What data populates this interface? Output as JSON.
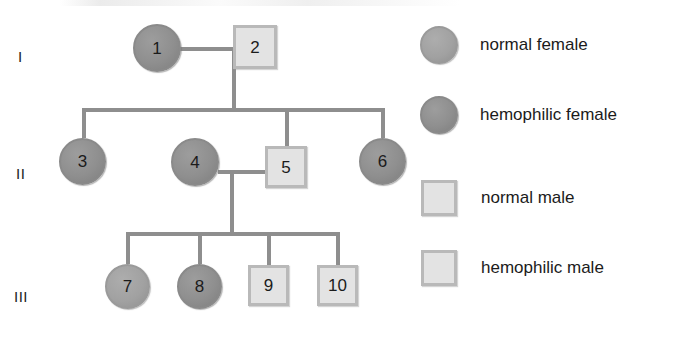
{
  "figure": {
    "type": "pedigree-chart"
  },
  "generations": [
    {
      "label": "I"
    },
    {
      "label": "II"
    },
    {
      "label": "III"
    }
  ],
  "individuals": [
    {
      "id": "1",
      "number": "1",
      "sex": "female",
      "symbol": "circle",
      "status": "hemophilic-female",
      "generation": "I"
    },
    {
      "id": "2",
      "number": "2",
      "sex": "male",
      "symbol": "square",
      "status": "normal-male",
      "generation": "I"
    },
    {
      "id": "3",
      "number": "3",
      "sex": "female",
      "symbol": "circle",
      "status": "hemophilic-female",
      "generation": "II"
    },
    {
      "id": "4",
      "number": "4",
      "sex": "female",
      "symbol": "circle",
      "status": "hemophilic-female",
      "generation": "II"
    },
    {
      "id": "5",
      "number": "5",
      "sex": "male",
      "symbol": "square",
      "status": "normal-male",
      "generation": "II"
    },
    {
      "id": "6",
      "number": "6",
      "sex": "female",
      "symbol": "circle",
      "status": "hemophilic-female",
      "generation": "II"
    },
    {
      "id": "7",
      "number": "7",
      "sex": "female",
      "symbol": "circle",
      "status": "normal-female",
      "generation": "III"
    },
    {
      "id": "8",
      "number": "8",
      "sex": "female",
      "symbol": "circle",
      "status": "hemophilic-female",
      "generation": "III"
    },
    {
      "id": "9",
      "number": "9",
      "sex": "male",
      "symbol": "square",
      "status": "normal-male",
      "generation": "III"
    },
    {
      "id": "10",
      "number": "10",
      "sex": "male",
      "symbol": "square",
      "status": "normal-male",
      "generation": "III"
    }
  ],
  "legend": {
    "items": [
      {
        "key": "normal-female",
        "symbol": "circle",
        "label": "normal female"
      },
      {
        "key": "hemophilic-female",
        "symbol": "circle",
        "label": "hemophilic female"
      },
      {
        "key": "normal-male",
        "symbol": "square",
        "label": "normal male"
      },
      {
        "key": "hemophilic-male",
        "symbol": "square",
        "label": "hemophilic male"
      }
    ]
  },
  "colors": {
    "line": "#8e8e8e",
    "female_fill": "#909090",
    "female_fill_light": "#a3a3a3",
    "male_fill": "#e3e3e3",
    "male_border": "#b9b9b9",
    "text": "#1b1b1b",
    "background": "#ffffff"
  }
}
